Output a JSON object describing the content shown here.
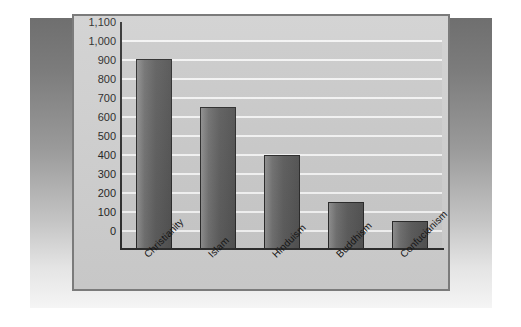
{
  "chart_data": {
    "type": "bar",
    "title": "",
    "subtitle": "",
    "xlabel": "",
    "ylabel": "",
    "categories": [
      "Christianity",
      "Islam",
      "Hinduism",
      "Buddhism",
      "Confucianism"
    ],
    "values": [
      1000,
      750,
      500,
      250,
      150
    ],
    "ylim": [
      0,
      1100
    ],
    "ytick_step": 100,
    "ytick_labels": [
      "1,100",
      "1,000",
      "900",
      "800",
      "700",
      "600",
      "500",
      "400",
      "300",
      "200",
      "100",
      "0"
    ],
    "ytick_values": [
      1100,
      1000,
      900,
      800,
      700,
      600,
      500,
      400,
      300,
      200,
      100,
      0
    ],
    "grid": true,
    "grid_orientation": "horizontal",
    "legend": false,
    "legend_position": "none",
    "series": [
      {
        "name": "",
        "values": [
          1000,
          750,
          500,
          250,
          150
        ]
      }
    ]
  },
  "colors": {
    "bar_fill_light": "#8d8d8d",
    "bar_fill_dark": "#4f4f4f",
    "bar_outline": "#262626",
    "plot_background": "#c9c9c9",
    "panel_background": "#cfcfcf",
    "panel_border": "#7b7b7b",
    "gridline": "#f4f4f4",
    "axis_line": "#2b2b2b",
    "label_text": "#1c1c1c",
    "page_background": "#ffffff",
    "backdrop_dark": "#6f6f6f",
    "backdrop_light": "#f5f5f5"
  }
}
